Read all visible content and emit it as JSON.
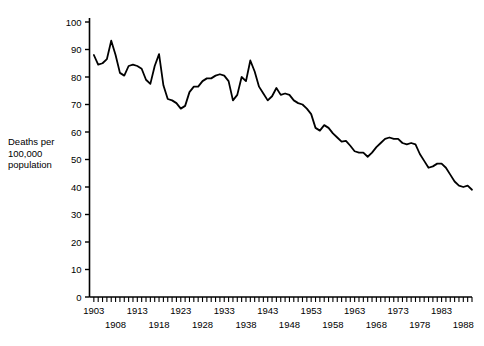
{
  "chart_data": {
    "type": "line",
    "title": "",
    "xlabel": "",
    "ylabel": "Deaths per 100,000 population",
    "ylabel_lines": [
      "Deaths per",
      "100,000",
      "population"
    ],
    "xlim": [
      1902,
      1990
    ],
    "ylim": [
      0,
      100
    ],
    "grid": false,
    "legend": "none",
    "y_ticks": [
      0,
      10,
      20,
      30,
      40,
      50,
      60,
      70,
      80,
      90,
      100
    ],
    "y_tick_labels": [
      "0",
      "10",
      "20",
      "30",
      "40",
      "50",
      "60",
      "70",
      "80",
      "90",
      "100"
    ],
    "x_tick_labels_upper": [
      "1903",
      "1913",
      "1923",
      "1933",
      "1943",
      "1953",
      "1963",
      "1973",
      "1983"
    ],
    "x_tick_labels_lower": [
      "1908",
      "1918",
      "1928",
      "1938",
      "1948",
      "1958",
      "1968",
      "1978",
      "1988"
    ],
    "x_tick_values_upper": [
      1903,
      1913,
      1923,
      1933,
      1943,
      1953,
      1963,
      1973,
      1983
    ],
    "x_tick_values_lower": [
      1908,
      1918,
      1928,
      1938,
      1948,
      1958,
      1968,
      1978,
      1988
    ],
    "x_minor_tick_interval": 1,
    "line_color": "#000000",
    "line_width": 1.8,
    "x": [
      1903,
      1904,
      1905,
      1906,
      1907,
      1908,
      1909,
      1910,
      1911,
      1912,
      1913,
      1914,
      1915,
      1916,
      1917,
      1918,
      1919,
      1920,
      1921,
      1922,
      1923,
      1924,
      1925,
      1926,
      1927,
      1928,
      1929,
      1930,
      1931,
      1932,
      1933,
      1934,
      1935,
      1936,
      1937,
      1938,
      1939,
      1940,
      1941,
      1942,
      1943,
      1944,
      1945,
      1946,
      1947,
      1948,
      1949,
      1950,
      1951,
      1952,
      1953,
      1954,
      1955,
      1956,
      1957,
      1958,
      1959,
      1960,
      1961,
      1962,
      1963,
      1964,
      1965,
      1966,
      1967,
      1968,
      1969,
      1970,
      1971,
      1972,
      1973,
      1974,
      1975,
      1976,
      1977,
      1978,
      1979,
      1980,
      1981,
      1982,
      1983,
      1984,
      1985,
      1986,
      1987,
      1988,
      1989,
      1990
    ],
    "values": [
      88.0,
      84.5,
      85.0,
      86.5,
      93.2,
      88.0,
      81.5,
      80.5,
      84.0,
      84.5,
      84.0,
      83.0,
      79.0,
      77.5,
      84.0,
      88.3,
      77.0,
      72.0,
      71.5,
      70.5,
      68.5,
      69.5,
      74.5,
      76.5,
      76.5,
      78.5,
      79.5,
      79.5,
      80.5,
      81.0,
      80.5,
      78.5,
      71.5,
      73.5,
      80.0,
      78.5,
      86.0,
      82.0,
      76.5,
      74.0,
      71.5,
      73.0,
      76.0,
      73.5,
      74.0,
      73.5,
      71.5,
      70.5,
      70.0,
      68.5,
      66.5,
      61.5,
      60.5,
      62.5,
      61.5,
      59.5,
      58.0,
      56.5,
      56.8,
      55.0,
      53.0,
      52.5,
      52.5,
      51.0,
      52.5,
      54.5,
      56.0,
      57.5,
      58.0,
      57.5,
      57.5,
      56.0,
      55.5,
      56.0,
      55.5,
      52.0,
      49.5,
      47.0,
      47.5,
      48.5,
      48.5,
      47.0,
      44.5,
      42.0,
      40.5,
      40.0,
      40.5,
      39.0
    ]
  }
}
